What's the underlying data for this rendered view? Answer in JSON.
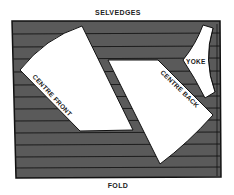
{
  "diagram": {
    "top_label": "SELVEDGES",
    "bottom_label": "FOLD",
    "pieces": [
      {
        "name": "centre-front",
        "label": "CENTRE FRONT"
      },
      {
        "name": "centre-back",
        "label": "CENTRE BACK"
      },
      {
        "name": "yoke",
        "label": "YOKE"
      }
    ],
    "colors": {
      "fabric": "#5a5a5a",
      "stripe": "#1c1c1c",
      "piece": "#ffffff",
      "outline": "#111111"
    }
  }
}
